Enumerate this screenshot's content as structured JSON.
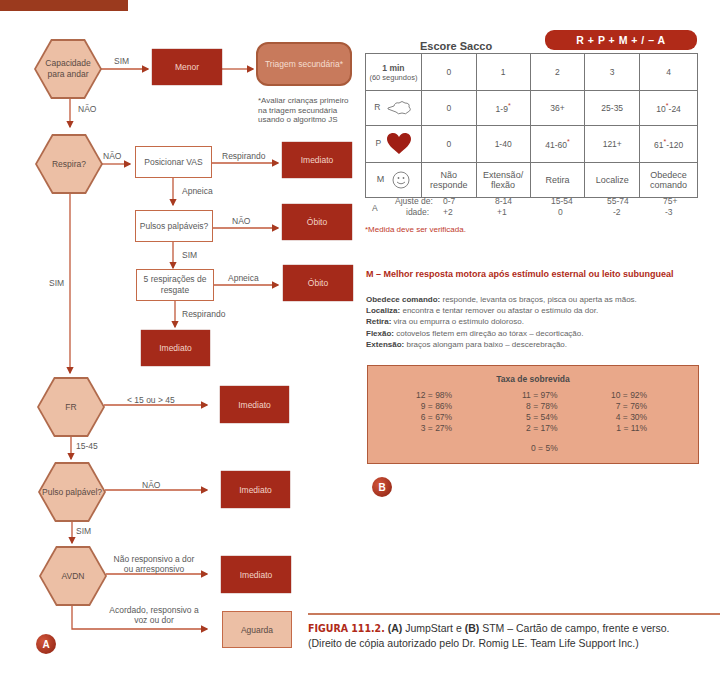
{
  "flowchart": {
    "nodes": {
      "walk": "Capacidade para andar",
      "minor": "Menor",
      "secondary": "Triagem secundária*",
      "secondary_note": "*Avaliar crianças primeiro na triagem secundária usando o algoritmo JS",
      "breathing": "Respira?",
      "position_airway": "Posicionar VAS",
      "immediate_1": "Imediato",
      "pulses": "Pulsos palpáveis?",
      "death_1": "Óbito",
      "rescue_breaths": "5 respirações de resgate",
      "death_2": "Óbito",
      "immediate_2": "Imediato",
      "rr": "FR",
      "immediate_3": "Imediato",
      "pulse": "Pulso palpável?",
      "immediate_4": "Imediato",
      "avpu": "AVDN",
      "immediate_5": "Imediato",
      "wait": "Aguarda"
    },
    "edges": {
      "walk_yes": "SIM",
      "walk_no": "NÃO",
      "breath_no": "NÃO",
      "breath_yes": "SIM",
      "breathing_label": "Respirando",
      "apnea_1": "Apneica",
      "pulses_no": "NÃO",
      "pulses_yes": "SIM",
      "apnea_2": "Apneica",
      "breathing_label_2": "Respirando",
      "rr_abnormal": "< 15 ou > 45",
      "rr_normal": "15-45",
      "pulse_no": "NÃO",
      "pulse_yes": "SIM",
      "avpu_unresponsive": "Não responsivo a dor ou arresponsivo",
      "avpu_responsive": "Acordado, responsivo a voz ou dor"
    },
    "badge": "A"
  },
  "sacco": {
    "title": "Escore Sacco",
    "formula": "R + P + M + / – A",
    "header": {
      "c0a": "1 min",
      "c0b": "(60 segundos)",
      "cols": [
        "0",
        "1",
        "2",
        "3",
        "4"
      ]
    },
    "rows": {
      "R": {
        "label": "R",
        "values": [
          "0",
          "1-9",
          "36+",
          "25-35",
          "24"
        ],
        "pre4": "10"
      },
      "P": {
        "label": "P",
        "values": [
          "0",
          "1-40",
          "41-60",
          "121+",
          "-120"
        ],
        "pre4": "61"
      },
      "M": {
        "label": "M",
        "values": [
          "Não responde",
          "Extensão/ flexão",
          "Retira",
          "Localize",
          "Obedece comando"
        ]
      }
    },
    "age": {
      "label": "A",
      "sub1": "Ajuste de:",
      "sub2": "idade:",
      "ranges": [
        "0-7",
        "8-14",
        "15-54",
        "55-74",
        "75+"
      ],
      "adjust": [
        "+2",
        "+1",
        "0",
        "-2",
        "-3"
      ]
    },
    "footnote": "*Medida deve ser verificada.",
    "asterisk": "*"
  },
  "motor": {
    "title": "M – Melhor resposta motora após estímulo esternal ou leito subungueal",
    "items": [
      {
        "term": "Obedece comando:",
        "desc": " responde, levanta os braços, pisca ou aperta as mãos."
      },
      {
        "term": "Localiza:",
        "desc": " encontra e tentar remover ou afastar o estímulo da dor."
      },
      {
        "term": "Retira:",
        "desc": " vira ou empurra o estímulo doloroso."
      },
      {
        "term": "Flexão:",
        "desc": " cotovelos fletem em direção ao tórax – decorticação."
      },
      {
        "term": "Extensão:",
        "desc": " braços alongam para baixo – descerebração."
      }
    ]
  },
  "survival": {
    "title": "Taxa de sobrevida",
    "col1": [
      "12 = 98%",
      "9 = 86%",
      "6 = 67%",
      "3 = 27%"
    ],
    "col2": [
      "11 = 97%",
      "8 = 78%",
      "5 = 54%",
      "2 = 17%"
    ],
    "col3": [
      "10 = 92%",
      "7 = 76%",
      "4 = 30%",
      "1 = 11%"
    ],
    "last": "0 = 5%",
    "badge": "B"
  },
  "caption": {
    "fig": "FIGURA 111.2.",
    "a": "(A)",
    "t1": " JumpStart e ",
    "b": "(B)",
    "t2": " STM – Cartão de campo, frente e verso.",
    "line2": "(Direito de cópia autorizado pelo Dr. Romig LE. Team Life Support Inc.)"
  }
}
